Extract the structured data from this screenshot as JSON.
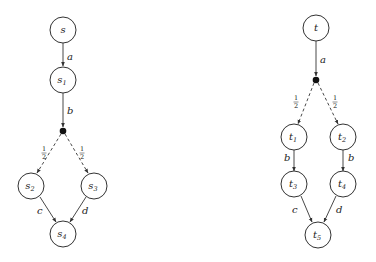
{
  "diagrams": [
    {
      "name": "left",
      "nodes": [
        {
          "id": "s",
          "base": "s",
          "sub": ""
        },
        {
          "id": "s1",
          "base": "s",
          "sub": "1"
        },
        {
          "id": "s2",
          "base": "s",
          "sub": "2"
        },
        {
          "id": "s3",
          "base": "s",
          "sub": "3"
        },
        {
          "id": "s4",
          "base": "s",
          "sub": "4"
        }
      ],
      "edges": [
        {
          "from": "s",
          "to": "s1",
          "label": "a"
        },
        {
          "from": "s1",
          "to": "dist",
          "label": "b"
        },
        {
          "from": "dist",
          "to": "s2",
          "label": "1/2",
          "style": "dashed"
        },
        {
          "from": "dist",
          "to": "s3",
          "label": "1/2",
          "style": "dashed"
        },
        {
          "from": "s2",
          "to": "s4",
          "label": "c"
        },
        {
          "from": "s3",
          "to": "s4",
          "label": "d"
        }
      ]
    },
    {
      "name": "right",
      "nodes": [
        {
          "id": "t",
          "base": "t",
          "sub": ""
        },
        {
          "id": "t1",
          "base": "t",
          "sub": "1"
        },
        {
          "id": "t2",
          "base": "t",
          "sub": "2"
        },
        {
          "id": "t3",
          "base": "t",
          "sub": "3"
        },
        {
          "id": "t4",
          "base": "t",
          "sub": "4"
        },
        {
          "id": "t5",
          "base": "t",
          "sub": "5"
        }
      ],
      "edges": [
        {
          "from": "t",
          "to": "dist",
          "label": "a"
        },
        {
          "from": "dist",
          "to": "t1",
          "label": "1/2",
          "style": "dashed"
        },
        {
          "from": "dist",
          "to": "t2",
          "label": "1/2",
          "style": "dashed"
        },
        {
          "from": "t1",
          "to": "t3",
          "label": "b"
        },
        {
          "from": "t2",
          "to": "t4",
          "label": "b"
        },
        {
          "from": "t3",
          "to": "t5",
          "label": "c"
        },
        {
          "from": "t4",
          "to": "t5",
          "label": "d"
        }
      ]
    }
  ],
  "labels": {
    "s": "s",
    "s1": "s",
    "s2": "s",
    "s3": "s",
    "s4": "s",
    "t": "t",
    "t1": "t",
    "t2": "t",
    "t3": "t",
    "t4": "t",
    "t5": "t",
    "sub1": "1",
    "sub2": "2",
    "sub3": "3",
    "sub4": "4",
    "sub5": "5",
    "a": "a",
    "b": "b",
    "c": "c",
    "d": "d",
    "half_num": "1",
    "half_den": "2"
  }
}
